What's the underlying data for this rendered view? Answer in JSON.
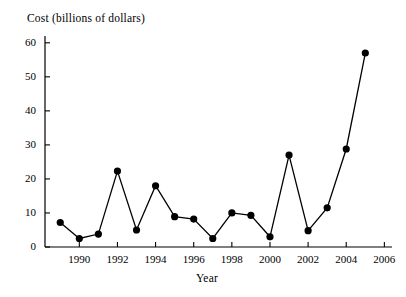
{
  "chart_data": {
    "type": "line",
    "title": "",
    "xlabel": "Year",
    "ylabel": "Cost (billions of dollars)",
    "x": [
      1989,
      1990,
      1991,
      1992,
      1993,
      1994,
      1995,
      1996,
      1997,
      1998,
      1999,
      2000,
      2001,
      2002,
      2003,
      2004,
      2005
    ],
    "values": [
      7.2,
      2.5,
      3.8,
      22.3,
      5.0,
      18.0,
      8.9,
      8.2,
      2.5,
      10.0,
      9.3,
      3.0,
      27.0,
      4.8,
      11.5,
      28.8,
      57.0
    ],
    "series": [
      {
        "name": "Cost",
        "values": [
          7.2,
          2.5,
          3.8,
          22.3,
          5.0,
          18.0,
          8.9,
          8.2,
          2.5,
          10.0,
          9.3,
          3.0,
          27.0,
          4.8,
          11.5,
          28.8,
          57.0
        ]
      }
    ],
    "xlim": [
      1988.2,
      2006.4
    ],
    "ylim": [
      0,
      62
    ],
    "xticks": [
      1990,
      1992,
      1994,
      1996,
      1998,
      2000,
      2002,
      2004,
      2006
    ],
    "xtick_labels": [
      "1990",
      "1992",
      "1994",
      "1996",
      "1998",
      "2000",
      "2002",
      "2004",
      "2006"
    ],
    "yticks": [
      0,
      10,
      20,
      30,
      40,
      50,
      60
    ],
    "ytick_labels": [
      "0",
      "10",
      "20",
      "30",
      "40",
      "50",
      "60"
    ],
    "grid": false,
    "legend": "none",
    "marker": "filled-circle",
    "line_color": "#000000",
    "marker_color": "#000000"
  },
  "axis": {
    "y_title": "Cost (billions of dollars)",
    "x_title": "Year"
  }
}
